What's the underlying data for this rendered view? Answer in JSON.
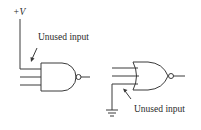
{
  "diagram": {
    "colors": {
      "stroke": "#3a3a3a",
      "text": "#2a2a2a",
      "background": "#ffffff"
    },
    "supply_label": "+V",
    "nand_gate": {
      "type": "NAND",
      "inputs": 3,
      "unused_input_connection": "+V",
      "annotation": "Unused input"
    },
    "nor_gate": {
      "type": "NOR",
      "inputs": 3,
      "unused_input_connection": "ground",
      "annotation": "Unused input"
    }
  }
}
